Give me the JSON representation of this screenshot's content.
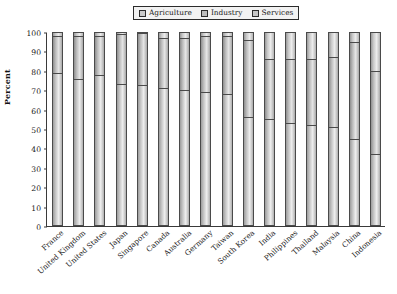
{
  "chart_data": {
    "type": "bar",
    "subtype": "stacked-bar-100-percent",
    "title": "",
    "xlabel": "",
    "ylabel": "Percent",
    "ylim": [
      0,
      100
    ],
    "yticks": [
      0,
      10,
      20,
      30,
      40,
      50,
      60,
      70,
      80,
      90,
      100
    ],
    "grid": false,
    "legend_position": "top-center",
    "categories": [
      "France",
      "United Kingdom",
      "United States",
      "Japan",
      "Singapore",
      "Canada",
      "Australia",
      "Germany",
      "Taiwan",
      "South Korea",
      "India",
      "Philippines",
      "Thailand",
      "Malaysia",
      "China",
      "Indonesia"
    ],
    "series": [
      {
        "name": "Services",
        "values": [
          79,
          76,
          78,
          73,
          73,
          71,
          70,
          69,
          68,
          56,
          55,
          53,
          52,
          51,
          45,
          37
        ]
      },
      {
        "name": "Industry",
        "values": [
          19,
          22,
          20,
          26,
          27,
          26,
          27,
          29,
          30,
          40,
          31,
          33,
          34,
          36,
          50,
          43
        ]
      },
      {
        "name": "Agriculture",
        "values": [
          2,
          2,
          2,
          1,
          0,
          3,
          3,
          2,
          2,
          4,
          14,
          14,
          14,
          13,
          5,
          20
        ]
      }
    ],
    "series_order_bottom_to_top": [
      "Services",
      "Industry",
      "Agriculture"
    ],
    "bar_totals": [
      100,
      100,
      100,
      100,
      100,
      100,
      100,
      100,
      100,
      100,
      100,
      100,
      100,
      100,
      100,
      100
    ]
  },
  "legend": {
    "entries": [
      {
        "label": "Agriculture",
        "color": "#c9c9c9"
      },
      {
        "label": "Industry",
        "color": "#bdbdbd"
      },
      {
        "label": "Services",
        "color": "#c6c6c6"
      }
    ]
  },
  "axis": {
    "y_title": "Percent"
  },
  "colors": {
    "axis": "#3a3a3a",
    "text": "#1a1a1a",
    "legend_background": "#f2f2f2",
    "legend_border": "#2b2b2b",
    "bar_outline": "#4a4a4a",
    "plot_background": "#ffffff"
  }
}
